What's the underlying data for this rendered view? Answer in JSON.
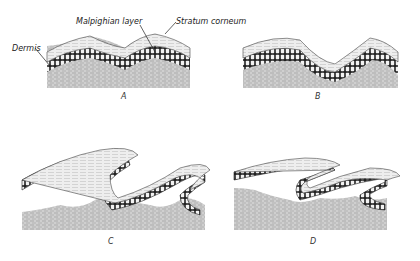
{
  "figure": {
    "labels": {
      "malpighian": "Malpighian layer",
      "stratum": "Stratum corneum",
      "dermis": "Dermis"
    },
    "panels": [
      {
        "id": "A",
        "label": "A"
      },
      {
        "id": "B",
        "label": "B"
      },
      {
        "id": "C",
        "label": "C"
      },
      {
        "id": "D",
        "label": "D"
      }
    ]
  }
}
